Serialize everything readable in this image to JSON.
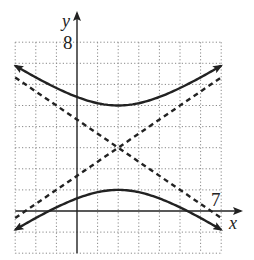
{
  "chart_data": {
    "type": "line",
    "title": "",
    "xlabel": "x",
    "ylabel": "y",
    "xlim": [
      -3,
      7
    ],
    "ylim": [
      -2,
      8
    ],
    "grid": true,
    "grid_style": "dotted",
    "tick_labels": {
      "x": [
        "7"
      ],
      "y": [
        "8"
      ]
    },
    "series": [
      {
        "name": "hyperbola-upper-branch",
        "style": "solid",
        "equation": "(y-3)^2/4 - (x-2)^2/9 = 1",
        "center": [
          2,
          3
        ],
        "vertex": [
          2,
          5
        ],
        "x": [
          -3,
          -2,
          -1,
          0,
          1,
          2,
          3,
          4,
          5,
          6,
          7
        ],
        "values": [
          6.89,
          6.33,
          5.83,
          5.4,
          5.11,
          5.0,
          5.11,
          5.4,
          5.83,
          6.33,
          6.89
        ]
      },
      {
        "name": "hyperbola-lower-branch",
        "style": "solid",
        "center": [
          2,
          3
        ],
        "vertex": [
          2,
          1
        ],
        "x": [
          -3,
          -2,
          -1,
          0,
          1,
          2,
          3,
          4,
          5,
          6,
          7
        ],
        "values": [
          -0.89,
          -0.33,
          0.17,
          0.6,
          0.89,
          1.0,
          0.89,
          0.6,
          0.17,
          -0.33,
          -0.89
        ]
      },
      {
        "name": "asymptote-1",
        "style": "dashed",
        "equation": "y = 3 + (2/3)(x - 2)",
        "x": [
          -3,
          7
        ],
        "values": [
          -0.33,
          6.33
        ]
      },
      {
        "name": "asymptote-2",
        "style": "dashed",
        "equation": "y = 3 - (2/3)(x - 2)",
        "x": [
          -3,
          7
        ],
        "values": [
          6.33,
          -0.33
        ]
      }
    ]
  },
  "labels": {
    "x_axis": "x",
    "y_axis": "y",
    "x_tick": "7",
    "y_tick": "8"
  }
}
